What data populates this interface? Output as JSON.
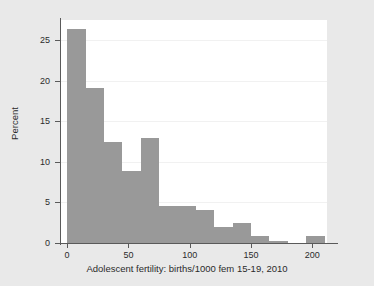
{
  "chart_data": {
    "type": "bar",
    "title": "",
    "subtitle": "",
    "xlabel": "Adolescent fertility: births/1000 fem 15-19, 2010",
    "ylabel": "Percent",
    "xlim": [
      -5,
      212
    ],
    "ylim": [
      0,
      27.5
    ],
    "bin_width": 15,
    "grid": true,
    "grid_axis": "y",
    "legend": null,
    "legend_position": "none",
    "bar_color": "#999999",
    "plot_background": "#ffffff",
    "figure_background": "#e9e9e9",
    "axis_color": "#5a5a5a",
    "gridline_color": "#f1f1f1",
    "x_ticks": [
      0,
      50,
      100,
      150,
      200
    ],
    "x_tick_labels": [
      "0",
      "50",
      "100",
      "150",
      "200"
    ],
    "y_ticks": [
      0,
      5,
      10,
      15,
      20,
      25
    ],
    "y_tick_labels": [
      "0",
      "5",
      "10",
      "15",
      "20",
      "25"
    ],
    "categories": [
      "0-15",
      "15-30",
      "30-45",
      "45-60",
      "60-75",
      "75-90",
      "90-105",
      "105-120",
      "120-135",
      "135-150",
      "150-165",
      "165-180",
      "180-195",
      "195-210"
    ],
    "bin_starts": [
      0,
      15,
      30,
      45,
      60,
      75,
      90,
      105,
      120,
      135,
      150,
      165,
      180,
      195
    ],
    "bin_ends": [
      15,
      30,
      45,
      60,
      75,
      90,
      105,
      120,
      135,
      150,
      165,
      180,
      195,
      210
    ],
    "values": [
      26.4,
      19.1,
      12.4,
      8.9,
      12.9,
      4.6,
      4.6,
      4.1,
      2.0,
      2.5,
      0.9,
      0.3,
      0.0,
      0.9
    ]
  }
}
